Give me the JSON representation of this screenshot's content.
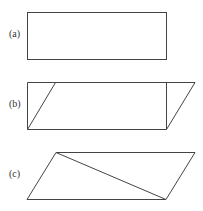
{
  "figures": [
    {
      "label": "(a)",
      "shape": "rectangle"
    },
    {
      "label": "(b)",
      "shape": "rectangle sheared into parallelogram"
    },
    {
      "label": "(c)",
      "shape": "parallelogram with diagonal"
    }
  ],
  "colors": {
    "stroke": "#444444",
    "background": "#ffffff"
  }
}
